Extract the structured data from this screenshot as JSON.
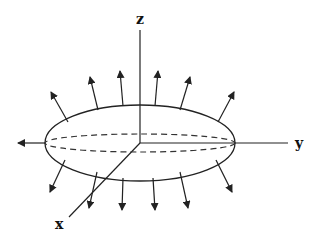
{
  "diagram": {
    "axes": {
      "z_label": "z",
      "y_label": "y",
      "x_label": "x"
    },
    "colors": {
      "stroke": "#222222",
      "background": "#ffffff"
    },
    "ellipsoid": {
      "cx": 140,
      "cy": 143,
      "rx": 95,
      "ry": 38
    },
    "arrows": {
      "top": [
        {
          "x1": 68,
          "y1": 122,
          "x2": 51,
          "y2": 92
        },
        {
          "x1": 98,
          "y1": 110,
          "x2": 90,
          "y2": 77
        },
        {
          "x1": 123,
          "y1": 106,
          "x2": 120,
          "y2": 71
        },
        {
          "x1": 155,
          "y1": 106,
          "x2": 158,
          "y2": 71
        },
        {
          "x1": 180,
          "y1": 110,
          "x2": 190,
          "y2": 77
        },
        {
          "x1": 218,
          "y1": 122,
          "x2": 234,
          "y2": 92
        }
      ],
      "bottom": [
        {
          "x1": 65,
          "y1": 160,
          "x2": 50,
          "y2": 192
        },
        {
          "x1": 97,
          "y1": 172,
          "x2": 89,
          "y2": 208
        },
        {
          "x1": 123,
          "y1": 178,
          "x2": 122,
          "y2": 210
        },
        {
          "x1": 153,
          "y1": 178,
          "x2": 155,
          "y2": 210
        },
        {
          "x1": 180,
          "y1": 172,
          "x2": 188,
          "y2": 208
        },
        {
          "x1": 216,
          "y1": 160,
          "x2": 232,
          "y2": 192
        }
      ],
      "left": {
        "x1": 45,
        "y1": 143,
        "x2": 18,
        "y2": 143
      }
    }
  }
}
